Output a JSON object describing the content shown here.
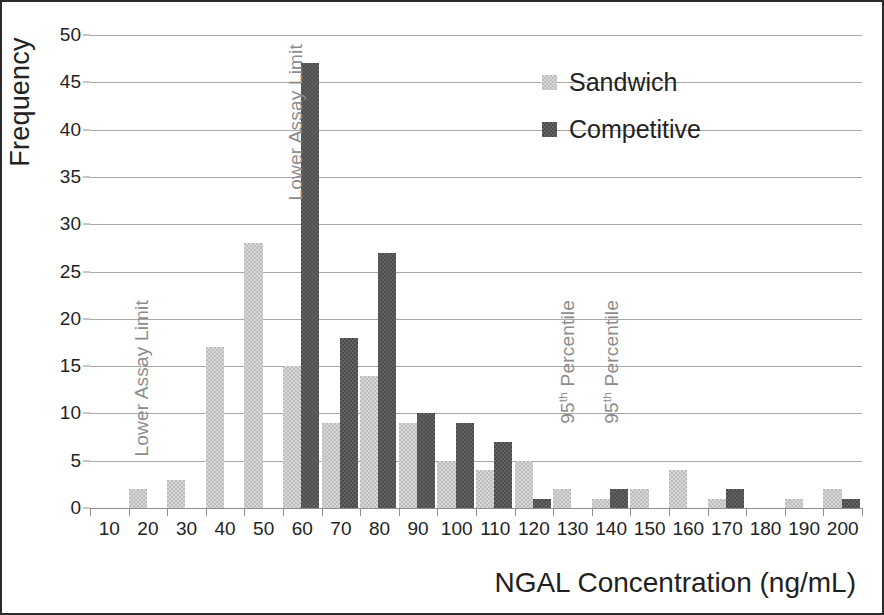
{
  "chart_data": {
    "type": "bar",
    "title": "",
    "subtitle": "",
    "xlabel": "NGAL Concentration (ng/mL)",
    "ylabel": "Frequency",
    "xlim": [
      5,
      205
    ],
    "ylim": [
      0,
      50
    ],
    "grid": true,
    "legend_position": "top-right",
    "x_tick_labels": [
      "10",
      "20",
      "30",
      "40",
      "50",
      "60",
      "70",
      "80",
      "90",
      "100",
      "110",
      "120",
      "130",
      "140",
      "150",
      "160",
      "170",
      "180",
      "190",
      "200"
    ],
    "y_tick_labels": [
      "0",
      "5",
      "10",
      "15",
      "20",
      "25",
      "30",
      "35",
      "40",
      "45",
      "50"
    ],
    "y_ticks": [
      0,
      5,
      10,
      15,
      20,
      25,
      30,
      35,
      40,
      45,
      50
    ],
    "categories": [
      10,
      20,
      30,
      40,
      50,
      60,
      70,
      80,
      90,
      100,
      110,
      120,
      130,
      140,
      150,
      160,
      170,
      180,
      190,
      200
    ],
    "series": [
      {
        "name": "Sandwich",
        "color": "#bdbdbd",
        "values": [
          0,
          2,
          3,
          17,
          28,
          15,
          9,
          14,
          9,
          5,
          4,
          5,
          2,
          1,
          2,
          4,
          1,
          0,
          1,
          2
        ]
      },
      {
        "name": "Competitive",
        "color": "#4c4c4c",
        "values": [
          0,
          0,
          0,
          0,
          0,
          47,
          18,
          27,
          10,
          9,
          7,
          1,
          0,
          2,
          0,
          0,
          2,
          0,
          0,
          1
        ]
      }
    ],
    "annotations": [
      {
        "text": "Lower Assay Limit",
        "html": "Lower Assay Limit",
        "x": 20,
        "series": "Sandwich",
        "color": "#8c8c8c",
        "orientation": "vertical"
      },
      {
        "text": "Lower Assay Limit",
        "html": "Lower Assay Limit",
        "x": 60,
        "series": "Competitive",
        "color": "#8c8c8c",
        "orientation": "vertical"
      },
      {
        "text": "95th Percentile",
        "html": "95<sup>th</sup> Percentile",
        "x": 130,
        "series": "Sandwich",
        "color": "#8c8c8c",
        "orientation": "vertical"
      },
      {
        "text": "95th Percentile",
        "html": "95<sup>th</sup> Percentile",
        "x": 142,
        "series": "Competitive",
        "color": "#8c8c8c",
        "orientation": "vertical"
      }
    ]
  },
  "legend": {
    "items": [
      {
        "label": "Sandwich",
        "key": "sandwich"
      },
      {
        "label": "Competitive",
        "key": "competitive"
      }
    ]
  },
  "axes": {
    "y_title": "Frequency",
    "x_title": "NGAL Concentration (ng/mL)"
  }
}
